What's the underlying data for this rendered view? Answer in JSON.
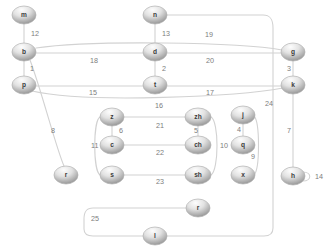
{
  "diagram": {
    "width": 326,
    "height": 250,
    "node_fill_top": "#f3f3f3",
    "node_fill_bottom": "#8e8e8e",
    "edge_color": "#d2d2d2",
    "label_color": "#7d7d7d",
    "background": "#ffffff"
  },
  "nodes": [
    {
      "id": "m",
      "label": "m",
      "x": 24,
      "y": 15,
      "rx": 12,
      "ry": 9
    },
    {
      "id": "b",
      "label": "b",
      "x": 24,
      "y": 52,
      "rx": 12,
      "ry": 9
    },
    {
      "id": "p",
      "label": "p",
      "x": 24,
      "y": 85,
      "rx": 12,
      "ry": 9
    },
    {
      "id": "n",
      "label": "n",
      "x": 155,
      "y": 15,
      "rx": 12,
      "ry": 9
    },
    {
      "id": "d",
      "label": "d",
      "x": 155,
      "y": 52,
      "rx": 12,
      "ry": 9
    },
    {
      "id": "t",
      "label": "t",
      "x": 155,
      "y": 85,
      "rx": 12,
      "ry": 9
    },
    {
      "id": "g",
      "label": "g",
      "x": 293,
      "y": 52,
      "rx": 12,
      "ry": 9
    },
    {
      "id": "k",
      "label": "k",
      "x": 293,
      "y": 85,
      "rx": 12,
      "ry": 9
    },
    {
      "id": "z",
      "label": "z",
      "x": 112,
      "y": 117,
      "rx": 12,
      "ry": 9
    },
    {
      "id": "c",
      "label": "c",
      "x": 112,
      "y": 145,
      "rx": 12,
      "ry": 9
    },
    {
      "id": "s",
      "label": "s",
      "x": 112,
      "y": 175,
      "rx": 12,
      "ry": 9
    },
    {
      "id": "zh",
      "label": "zh",
      "x": 198,
      "y": 117,
      "rx": 13,
      "ry": 9
    },
    {
      "id": "ch",
      "label": "ch",
      "x": 198,
      "y": 145,
      "rx": 13,
      "ry": 9
    },
    {
      "id": "sh",
      "label": "sh",
      "x": 198,
      "y": 175,
      "rx": 13,
      "ry": 9
    },
    {
      "id": "j",
      "label": "j",
      "x": 243,
      "y": 115,
      "rx": 12,
      "ry": 9
    },
    {
      "id": "q",
      "label": "q",
      "x": 243,
      "y": 145,
      "rx": 12,
      "ry": 9
    },
    {
      "id": "x",
      "label": "x",
      "x": 243,
      "y": 175,
      "rx": 12,
      "ry": 9
    },
    {
      "id": "h",
      "label": "h",
      "x": 293,
      "y": 176,
      "rx": 12,
      "ry": 9
    },
    {
      "id": "r",
      "label": "r",
      "x": 66,
      "y": 175,
      "rx": 12,
      "ry": 9
    },
    {
      "id": "r2",
      "label": "r",
      "x": 198,
      "y": 208,
      "rx": 12,
      "ry": 9
    },
    {
      "id": "l",
      "label": "l",
      "x": 155,
      "y": 236,
      "rx": 12,
      "ry": 9
    }
  ],
  "edges": [
    {
      "id": "e12",
      "label": "12",
      "source": "m",
      "target": "b",
      "path": "M 24 24 L 24 43",
      "label_x": 31,
      "label_y": 34
    },
    {
      "id": "e1",
      "label": "1",
      "source": "b",
      "target": "p",
      "path": "M 24 61 L 24 76",
      "label_x": 30,
      "label_y": 69
    },
    {
      "id": "e13",
      "label": "13",
      "source": "n",
      "target": "d",
      "path": "M 155 24 L 155 43",
      "label_x": 162,
      "label_y": 34
    },
    {
      "id": "e2",
      "label": "2",
      "source": "d",
      "target": "t",
      "path": "M 155 61 L 155 76",
      "label_x": 162,
      "label_y": 69
    },
    {
      "id": "e3",
      "label": "3",
      "source": "g",
      "target": "k",
      "path": "M 293 61 L 293 76",
      "label_x": 287,
      "label_y": 69
    },
    {
      "id": "e18",
      "label": "18",
      "source": "b",
      "target": "d",
      "path": "M 36 53 L 143 53",
      "label_x": 90,
      "label_y": 61
    },
    {
      "id": "e20",
      "label": "20",
      "source": "d",
      "target": "g",
      "path": "M 167 53 L 281 53",
      "label_x": 206,
      "label_y": 61
    },
    {
      "id": "e19",
      "label": "19",
      "source": "b",
      "target": "g",
      "path": "M 36 48 C 90 40, 240 42, 282 50",
      "label_x": 205,
      "label_y": 35
    },
    {
      "id": "e15",
      "label": "15",
      "source": "p",
      "target": "t",
      "path": "M 36 86 L 143 86",
      "label_x": 89,
      "label_y": 93
    },
    {
      "id": "e17",
      "label": "17",
      "source": "t",
      "target": "k",
      "path": "M 167 86 L 281 86",
      "label_x": 206,
      "label_y": 93
    },
    {
      "id": "e16",
      "label": "16",
      "source": "p",
      "target": "k",
      "path": "M 32 91 C 90 104, 240 96, 283 88",
      "label_x": 155,
      "label_y": 106
    },
    {
      "id": "e8",
      "label": "8",
      "source": "b",
      "target": "r",
      "path": "M 30 60 C 42 92, 56 148, 64 166",
      "label_x": 51,
      "label_y": 131
    },
    {
      "id": "e6",
      "label": "6",
      "source": "z",
      "target": "c",
      "path": "M 112 126 L 112 136",
      "label_x": 119,
      "label_y": 131
    },
    {
      "id": "e11",
      "label": "11",
      "source": "z",
      "target": "s",
      "path": "M 100 117 C 93 121, 93 170, 100 175",
      "label_x": 91,
      "label_y": 146
    },
    {
      "id": "e21",
      "label": "21",
      "source": "z",
      "target": "zh",
      "path": "M 124 117 L 185 117",
      "label_x": 156,
      "label_y": 126
    },
    {
      "id": "e22",
      "label": "22",
      "source": "c",
      "target": "ch",
      "path": "M 124 145 L 185 145",
      "label_x": 156,
      "label_y": 153
    },
    {
      "id": "e23",
      "label": "23",
      "source": "s",
      "target": "sh",
      "path": "M 124 175 L 185 175",
      "label_x": 156,
      "label_y": 182
    },
    {
      "id": "e5",
      "label": "5",
      "source": "zh",
      "target": "ch",
      "path": "M 198 126 L 198 136",
      "label_x": 194,
      "label_y": 131
    },
    {
      "id": "e10",
      "label": "10",
      "source": "zh",
      "target": "sh",
      "path": "M 211 117 C 219 121, 219 170, 211 175",
      "label_x": 220,
      "label_y": 146
    },
    {
      "id": "e4",
      "label": "4",
      "source": "j",
      "target": "q",
      "path": "M 243 124 L 243 136",
      "label_x": 237,
      "label_y": 130
    },
    {
      "id": "e9",
      "label": "9",
      "source": "j",
      "target": "x",
      "path": "M 254 116 C 260 122, 260 169, 254 175",
      "label_x": 251,
      "label_y": 157
    },
    {
      "id": "e24",
      "label": "24",
      "source": "n",
      "target": "l",
      "path": "M 167 15 L 263 15 C 271 15, 273 20, 273 28 L 273 228 C 273 234, 270 236, 264 236 L 167 236",
      "label_x": 265,
      "label_y": 104
    },
    {
      "id": "e7",
      "label": "7",
      "source": "k",
      "target": "h",
      "path": "M 293 94 L 293 167",
      "label_x": 287,
      "label_y": 131
    },
    {
      "id": "e14",
      "label": "14",
      "source": "h",
      "target": "h",
      "path": "M 303 172 C 312 172, 312 181, 303 181",
      "label_x": 315,
      "label_y": 177
    },
    {
      "id": "e25",
      "label": "25",
      "source": "r2",
      "target": "l",
      "path": "M 186 208 L 93 208 C 86 208, 84 212, 84 219 L 84 229 C 84 234, 87 236, 93 236 L 143 236",
      "label_x": 91,
      "label_y": 219
    }
  ]
}
